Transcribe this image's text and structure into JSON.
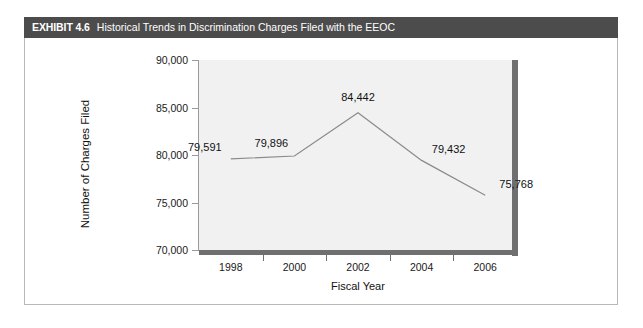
{
  "exhibit": {
    "number": "EXHIBIT 4.6",
    "title": "Historical Trends in Discrimination Charges Filed with the EEOC"
  },
  "chart_data": {
    "type": "line",
    "title": "Historical Trends in Discrimination Charges Filed with the EEOC",
    "xlabel": "Fiscal Year",
    "ylabel": "Number of Charges Filed",
    "x": [
      1998,
      2000,
      2002,
      2004,
      2006
    ],
    "values": [
      79591,
      79896,
      84442,
      79432,
      75768
    ],
    "point_labels": [
      "79,591",
      "79,896",
      "84,442",
      "79,432",
      "75,768"
    ],
    "xlim": [
      1997,
      2007
    ],
    "ylim": [
      70000,
      90000
    ],
    "ytick_labels": [
      "70,000",
      "75,000",
      "80,000",
      "85,000",
      "90,000"
    ],
    "yticks": [
      70000,
      75000,
      80000,
      85000,
      90000
    ],
    "xtick_labels": [
      "1998",
      "2000",
      "2002",
      "2004",
      "2006"
    ],
    "xticks": [
      1998,
      2000,
      2002,
      2004,
      2006
    ],
    "minor_xticks": [
      1999,
      2001,
      2003,
      2005
    ],
    "grid": false,
    "legend": false,
    "line_color": "#8a8a8a",
    "plot_background": "#f1f1f2",
    "axis_color": "#6f6f6f",
    "header_background": "#4c4c4c",
    "header_text_color": "#ffffff"
  }
}
